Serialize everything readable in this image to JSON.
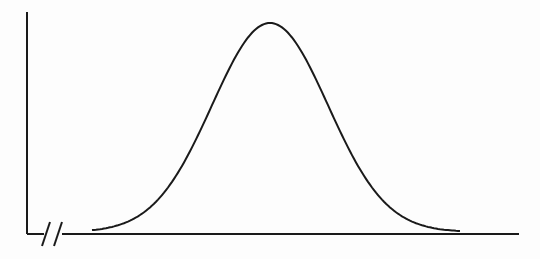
{
  "diagram": {
    "type": "normal-distribution-curve",
    "axes": {
      "y_axis": {
        "x": 27,
        "y_top": 12,
        "y_bottom": 234
      },
      "x_axis": {
        "y": 234,
        "x_start": 27,
        "x_end": 519
      },
      "axis_break": {
        "symbol": "double-slash",
        "x": 50,
        "y": 234
      }
    },
    "curve": {
      "shape": "bell",
      "center_x": 270,
      "peak_y": 23,
      "baseline_y": 232,
      "sigma_px": 58,
      "x_start": 92,
      "x_end": 460
    },
    "colors": {
      "stroke": "#1a1a1a",
      "background": "#fdfdfd"
    }
  }
}
